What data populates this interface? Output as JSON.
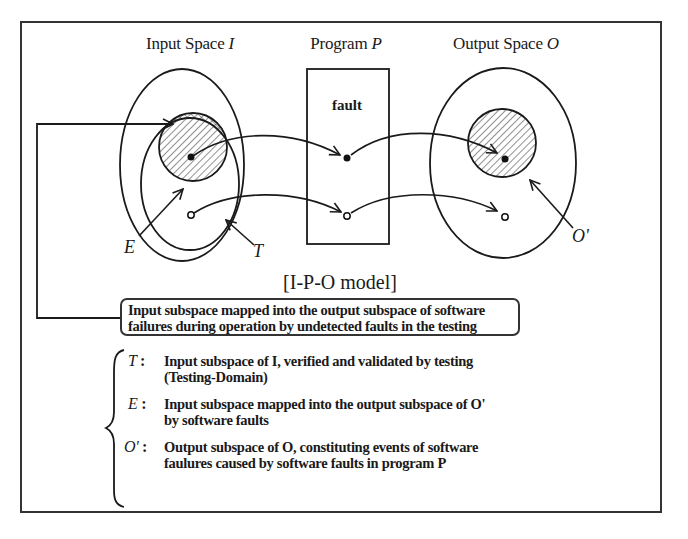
{
  "diagram": {
    "type": "I-P-O model",
    "titles": {
      "input_space": "Input Space",
      "input_space_symbol": "I",
      "program": "Program",
      "program_symbol": "P",
      "output_space": "Output Space",
      "output_space_symbol": "O"
    },
    "program_box": {
      "label": "fault"
    },
    "region_labels": {
      "E": "E",
      "T": "T",
      "O_prime": "O'"
    },
    "caption": "[I-P-O model]",
    "callout": {
      "line1": "Input subspace mapped into the output subspace of software",
      "line2": "failures during operation by undetected faults in the testing"
    },
    "legend": [
      {
        "symbol": "T",
        "colon": ":",
        "line1": "Input subspace of I, verified and validated by testing",
        "line2": "(Testing-Domain)"
      },
      {
        "symbol": "E",
        "colon": ":",
        "line1": "Input subspace mapped into the output subspace of O'",
        "line2": "by software faults"
      },
      {
        "symbol": "O'",
        "colon": ":",
        "line1": "Output subspace of O, constituting events of software",
        "line2": "faulures caused by software faults in program P"
      }
    ],
    "colors": {
      "ink": "#1a1a1a",
      "frame": "#333333",
      "background": "#ffffff"
    }
  }
}
